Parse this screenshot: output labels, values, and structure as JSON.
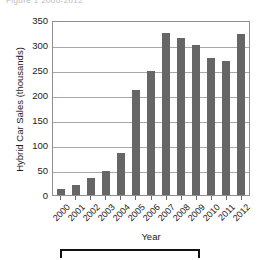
{
  "figure": {
    "caption_clipped": "Figure 1  2000-2012"
  },
  "chart_data": {
    "type": "bar",
    "title": "",
    "xlabel": "Year",
    "ylabel": "Hybrid Car Sales (thousands)",
    "categories": [
      "2000",
      "2001",
      "2002",
      "2003",
      "2004",
      "2005",
      "2006",
      "2007",
      "2008",
      "2009",
      "2010",
      "2011",
      "2012"
    ],
    "values": [
      12,
      21,
      35,
      48,
      85,
      210,
      248,
      325,
      315,
      300,
      274,
      268,
      322
    ],
    "ylim": [
      0,
      350
    ],
    "yticks": [
      0,
      50,
      100,
      150,
      200,
      250,
      300,
      350
    ],
    "ytick_labels": [
      "0",
      "50",
      "100",
      "150",
      "200",
      "250",
      "300",
      "350"
    ],
    "grid": true,
    "legend": "none",
    "bar_color": "#666666",
    "gridline_color": "#a8a8a8",
    "axis_color": "#8f8f8f"
  }
}
